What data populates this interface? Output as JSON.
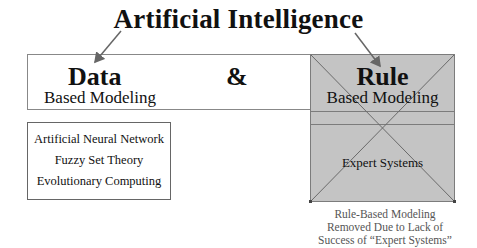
{
  "title": "Artificial Intelligence",
  "left": {
    "heading": "Data",
    "subheading": "Based Modeling",
    "methods": [
      "Artificial Neural Network",
      "Fuzzy Set Theory",
      "Evolutionary Computing"
    ]
  },
  "connector": "&",
  "right": {
    "heading": "Rule",
    "subheading": "Based Modeling",
    "item": "Expert Systems",
    "status": "crossed-out",
    "note_lines": [
      "Rule-Based Modeling",
      "Removed Due to Lack of",
      "Success of “Expert Systems”"
    ]
  },
  "colors": {
    "panel_fill": "#c4c4c4",
    "panel_border": "#7c7c7c",
    "arrow": "#666666",
    "note_text": "#555555"
  }
}
